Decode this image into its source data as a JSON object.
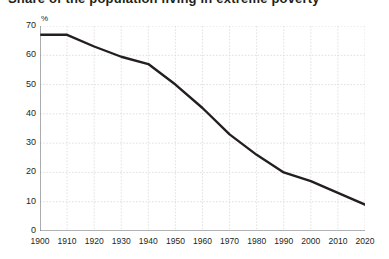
{
  "title": "Share of the population living in extreme poverty",
  "chart_data": {
    "type": "line",
    "title": "Share of the population living in extreme poverty",
    "unit_label": "%",
    "xlabel": "",
    "ylabel": "%",
    "grid": true,
    "legend": "none",
    "xlim": [
      1900,
      2020
    ],
    "ylim": [
      0,
      70
    ],
    "yticks": [
      0,
      10,
      20,
      30,
      40,
      50,
      60,
      70
    ],
    "xticks": [
      1900,
      1910,
      1920,
      1930,
      1940,
      1950,
      1960,
      1970,
      1980,
      1990,
      2000,
      2010,
      2020
    ],
    "line_color": "#231f20",
    "x": [
      1900,
      1910,
      1920,
      1930,
      1940,
      1950,
      1960,
      1970,
      1980,
      1990,
      2000,
      2010,
      2020
    ],
    "values": [
      67,
      67,
      63,
      59.5,
      57,
      50,
      42,
      33,
      26,
      20,
      17,
      13,
      9
    ],
    "series": [
      {
        "name": "Share of population",
        "values": [
          67,
          67,
          63,
          59.5,
          57,
          50,
          42,
          33,
          26,
          20,
          17,
          13,
          9
        ]
      }
    ]
  }
}
